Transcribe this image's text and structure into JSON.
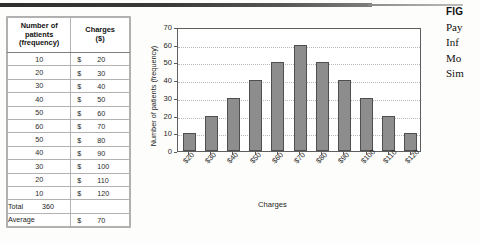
{
  "page": {
    "background_color": "#fdfdfb",
    "rule_color": "#2e2e2e"
  },
  "table": {
    "headers": {
      "frequency": "Number of patients (frequency)",
      "frequency_line1": "Number of",
      "frequency_line2": "patients",
      "frequency_line3": "(frequency)",
      "charges_line1": "Charges",
      "charges_line2": "($)"
    },
    "currency_symbol": "$",
    "rows": [
      {
        "frequency": "10",
        "charge": "20"
      },
      {
        "frequency": "20",
        "charge": "30"
      },
      {
        "frequency": "30",
        "charge": "40"
      },
      {
        "frequency": "40",
        "charge": "50"
      },
      {
        "frequency": "50",
        "charge": "60"
      },
      {
        "frequency": "60",
        "charge": "70"
      },
      {
        "frequency": "50",
        "charge": "80"
      },
      {
        "frequency": "40",
        "charge": "90"
      },
      {
        "frequency": "30",
        "charge": "100"
      },
      {
        "frequency": "20",
        "charge": "110"
      },
      {
        "frequency": "10",
        "charge": "120"
      }
    ],
    "total": {
      "label": "Total",
      "value": "360"
    },
    "average": {
      "label": "Average",
      "currency_symbol": "$",
      "value": "70"
    }
  },
  "chart_data": {
    "type": "bar",
    "title": "",
    "xlabel": "Charges",
    "ylabel": "Number of patients (frequency)",
    "categories": [
      "$20",
      "$30",
      "$40",
      "$50",
      "$60",
      "$70",
      "$80",
      "$90",
      "$100",
      "$110",
      "$120"
    ],
    "values": [
      10,
      20,
      30,
      40,
      50,
      60,
      50,
      40,
      30,
      20,
      10
    ],
    "ylim": [
      0,
      70
    ],
    "yticks": [
      "0",
      "10",
      "20",
      "30",
      "40",
      "50",
      "60",
      "70"
    ],
    "grid": true,
    "legend": "none",
    "bar_color": "#8d8d8d",
    "bar_border_color": "#4f4f4f"
  },
  "caption": {
    "fig_label": "FIG",
    "lines": [
      "Pay",
      "Inf",
      "Mo",
      "Sim"
    ]
  }
}
